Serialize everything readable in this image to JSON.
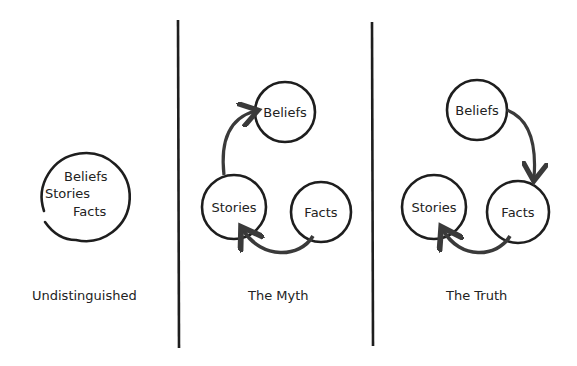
{
  "panels": [
    {
      "caption": "Undistinguished",
      "circle_labels": [
        "Beliefs",
        "Stories",
        "Facts"
      ]
    },
    {
      "caption": "The Myth",
      "nodes": {
        "beliefs": "Beliefs",
        "stories": "Stories",
        "facts": "Facts"
      },
      "arrows": [
        "Facts -> Stories",
        "Stories -> Beliefs"
      ]
    },
    {
      "caption": "The Truth",
      "nodes": {
        "beliefs": "Beliefs",
        "stories": "Stories",
        "facts": "Facts"
      },
      "arrows": [
        "Beliefs -> Facts",
        "Facts -> Stories"
      ]
    }
  ],
  "colors": {
    "ink": "#1e1e1e",
    "arrow": "#3a3a3a",
    "background": "#ffffff"
  }
}
